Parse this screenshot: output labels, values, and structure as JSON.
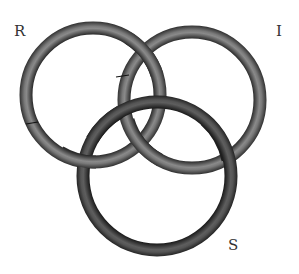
{
  "diagram": {
    "type": "borromean-rings",
    "labels": {
      "r": "R",
      "i": "I",
      "s": "S"
    },
    "rings": [
      {
        "id": "R",
        "cx": 93,
        "cy": 95,
        "r": 67
      },
      {
        "id": "I",
        "cx": 192,
        "cy": 100,
        "r": 68
      },
      {
        "id": "S",
        "cx": 157,
        "cy": 176,
        "r": 74
      }
    ],
    "colors": {
      "ring_dark": "#2a2a2a",
      "ring_mid": "#6a6a6a",
      "ring_light": "#9a9a9a",
      "label": "#333333",
      "background": "#ffffff"
    }
  }
}
